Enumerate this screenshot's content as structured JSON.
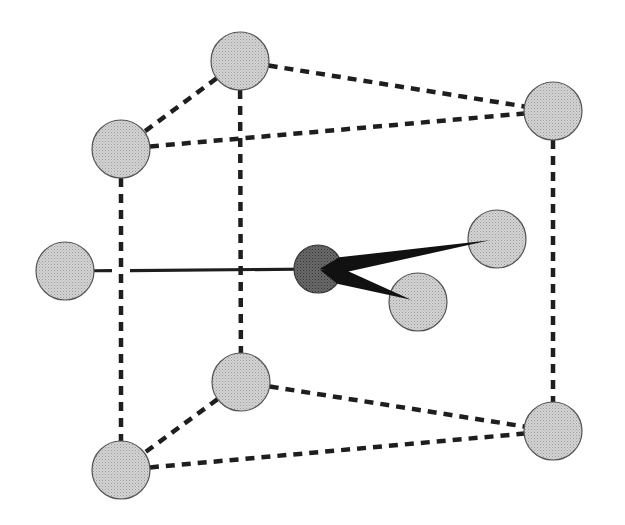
{
  "diagram": {
    "type": "coordination-geometry",
    "colors": {
      "background": "#ffffff",
      "ligand_fill": "#c8c8c8",
      "central_fill": "#5a5a5a",
      "outline": "#555555",
      "edge": "#1e1e1e"
    },
    "atoms": [
      {
        "id": "top-back",
        "role": "ligand",
        "cx": 240,
        "cy": 61,
        "r": 29
      },
      {
        "id": "top-front-left",
        "role": "ligand",
        "cx": 121,
        "cy": 149,
        "r": 29
      },
      {
        "id": "top-right",
        "role": "ligand",
        "cx": 553,
        "cy": 111,
        "r": 29
      },
      {
        "id": "left",
        "role": "ligand",
        "cx": 65,
        "cy": 271,
        "r": 29
      },
      {
        "id": "center",
        "role": "central",
        "cx": 318,
        "cy": 269,
        "r": 24
      },
      {
        "id": "right",
        "role": "ligand",
        "cx": 497,
        "cy": 239,
        "r": 29
      },
      {
        "id": "lower",
        "role": "ligand",
        "cx": 418,
        "cy": 302,
        "r": 29
      },
      {
        "id": "bottom-back",
        "role": "ligand",
        "cx": 241,
        "cy": 382,
        "r": 29
      },
      {
        "id": "bottom-front-left",
        "role": "ligand",
        "cx": 121,
        "cy": 470,
        "r": 29
      },
      {
        "id": "bottom-right",
        "role": "ligand",
        "cx": 553,
        "cy": 431,
        "r": 29
      }
    ],
    "dashed_edges": [
      [
        "top-back",
        "top-front-left"
      ],
      [
        "top-back",
        "top-right"
      ],
      [
        "top-front-left",
        "top-right"
      ],
      [
        "top-back",
        "bottom-back"
      ],
      [
        "top-front-left",
        "bottom-front-left"
      ],
      [
        "top-right",
        "bottom-right"
      ],
      [
        "bottom-back",
        "bottom-front-left"
      ],
      [
        "bottom-back",
        "bottom-right"
      ],
      [
        "bottom-front-left",
        "bottom-right"
      ]
    ],
    "solid_bonds": [
      [
        "center",
        "left"
      ]
    ],
    "wedge_bonds": [
      [
        "center",
        "right"
      ],
      [
        "center",
        "lower"
      ]
    ]
  }
}
